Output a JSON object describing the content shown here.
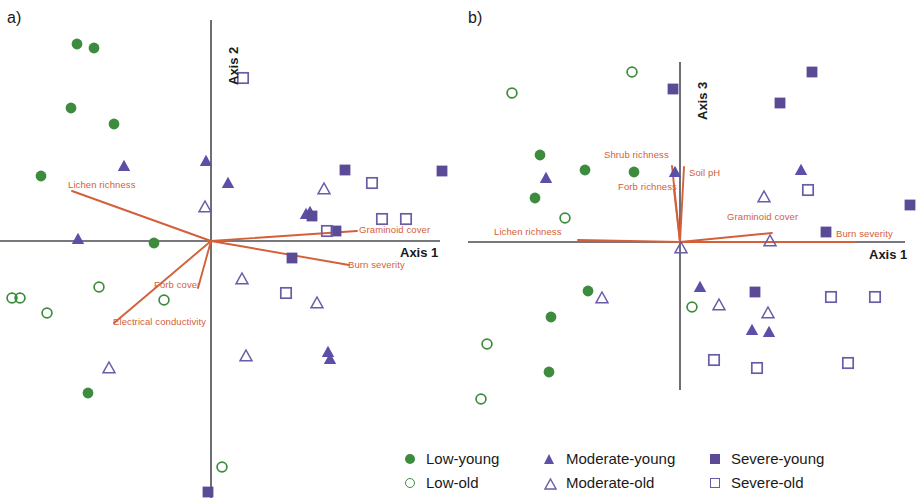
{
  "figure": {
    "panels": [
      {
        "letter": "a)",
        "x_axis_label": "Axis 1",
        "y_axis_label": "Axis 2"
      },
      {
        "letter": "b)",
        "x_axis_label": "Axis 1",
        "y_axis_label": "Axis 3"
      }
    ]
  },
  "legend": {
    "items": [
      {
        "label": "Low-young",
        "symbol": "filled-circle",
        "color": "#3d8b3d"
      },
      {
        "label": "Low-old",
        "symbol": "open-circle",
        "color": "#3d8b3d"
      },
      {
        "label": "Moderate-young",
        "symbol": "filled-triangle",
        "color": "#5b4fa8"
      },
      {
        "label": "Moderate-old",
        "symbol": "open-triangle",
        "color": "#6b5ca8"
      },
      {
        "label": "Severe-young",
        "symbol": "filled-square",
        "color": "#5b4a96"
      },
      {
        "label": "Severe-old",
        "symbol": "open-square",
        "color": "#6b5ca8"
      }
    ]
  },
  "colors": {
    "vector": "#d4603a",
    "vector_label": "#d4603a",
    "axis": "#4a4a52",
    "low": "#3d8b3d",
    "moderate": "#5b4fa8",
    "severe": "#5b4a96",
    "text": "#1a1a1a"
  },
  "chart_data": [
    {
      "type": "scatter",
      "title": "a)",
      "xlabel": "Axis 1",
      "ylabel": "Axis 2",
      "xlim": [
        -1.0,
        1.0
      ],
      "ylim": [
        -1.0,
        1.0
      ],
      "grid": false,
      "origin_px": [
        211,
        241
      ],
      "series": [
        {
          "name": "Low-young",
          "symbol": "filled-circle",
          "points_px": [
            [
              77,
              44
            ],
            [
              94,
              48
            ],
            [
              71,
              108
            ],
            [
              114,
              124
            ],
            [
              41,
              176
            ],
            [
              154,
              243
            ],
            [
              88,
              393
            ]
          ]
        },
        {
          "name": "Low-old",
          "symbol": "open-circle",
          "points_px": [
            [
              99,
              287
            ],
            [
              47,
              313
            ],
            [
              12,
              298
            ],
            [
              20,
              298
            ],
            [
              164,
              300
            ],
            [
              222,
              467
            ]
          ]
        },
        {
          "name": "Moderate-young",
          "symbol": "filled-triangle",
          "points_px": [
            [
              206,
              161
            ],
            [
              124,
              166
            ],
            [
              228,
              183
            ],
            [
              78,
              239
            ],
            [
              306,
              214
            ],
            [
              310,
              212
            ],
            [
              328,
              352
            ],
            [
              330,
              359
            ]
          ]
        },
        {
          "name": "Moderate-old",
          "symbol": "open-triangle",
          "points_px": [
            [
              205,
              207
            ],
            [
              324,
              189
            ],
            [
              317,
              303
            ],
            [
              242,
              279
            ],
            [
              246,
              356
            ],
            [
              109,
              368
            ]
          ]
        },
        {
          "name": "Severe-young",
          "symbol": "filled-square",
          "points_px": [
            [
              345,
              170
            ],
            [
              442,
              171
            ],
            [
              312,
              216
            ],
            [
              336,
              231
            ],
            [
              292,
              258
            ],
            [
              208,
              492
            ]
          ]
        },
        {
          "name": "Severe-old",
          "symbol": "open-square",
          "points_px": [
            [
              243,
              78
            ],
            [
              372,
              183
            ],
            [
              382,
              219
            ],
            [
              406,
              219
            ],
            [
              327,
              231
            ],
            [
              286,
              293
            ]
          ]
        }
      ],
      "vectors": [
        {
          "name": "Lichen richness",
          "label": "Lichen richness",
          "tip_px": [
            72,
            191
          ],
          "from_px": [
            211,
            241
          ]
        },
        {
          "name": "Forb cover",
          "label": "Forb cover",
          "tip_px": [
            198,
            288
          ],
          "from_px": [
            211,
            241
          ]
        },
        {
          "name": "Electrical conductivity",
          "label": "Electrical conductivity",
          "tip_px": [
            114,
            323
          ],
          "from_px": [
            211,
            241
          ]
        },
        {
          "name": "Graminoid cover",
          "label": "Graminoid cover",
          "tip_px": [
            357,
            231
          ],
          "from_px": [
            211,
            241
          ]
        },
        {
          "name": "Burn severity",
          "label": "Burn severity",
          "tip_px": [
            349,
            265
          ],
          "from_px": [
            211,
            241
          ]
        }
      ]
    },
    {
      "type": "scatter",
      "title": "b)",
      "xlabel": "Axis 1",
      "ylabel": "Axis 3",
      "xlim": [
        -1.0,
        1.0
      ],
      "ylim": [
        -1.0,
        1.0
      ],
      "grid": false,
      "origin_px": [
        680,
        242
      ],
      "series": [
        {
          "name": "Low-young",
          "symbol": "filled-circle",
          "points_px": [
            [
              540,
              155
            ],
            [
              585,
              170
            ],
            [
              634,
              172
            ],
            [
              535,
              198
            ],
            [
              588,
              291
            ],
            [
              551,
              317
            ],
            [
              549,
              372
            ]
          ]
        },
        {
          "name": "Low-old",
          "symbol": "open-circle",
          "points_px": [
            [
              512,
              93
            ],
            [
              632,
              72
            ],
            [
              565,
              218
            ],
            [
              692,
              307
            ],
            [
              487,
              344
            ],
            [
              481,
              399
            ]
          ]
        },
        {
          "name": "Moderate-young",
          "symbol": "filled-triangle",
          "points_px": [
            [
              546,
              178
            ],
            [
              675,
              172
            ],
            [
              801,
              170
            ],
            [
              700,
              287
            ],
            [
              752,
              330
            ],
            [
              769,
              332
            ]
          ]
        },
        {
          "name": "Moderate-old",
          "symbol": "open-triangle",
          "points_px": [
            [
              764,
              197
            ],
            [
              681,
              248
            ],
            [
              770,
              241
            ],
            [
              602,
              298
            ],
            [
              719,
              305
            ],
            [
              768,
              313
            ]
          ]
        },
        {
          "name": "Severe-young",
          "symbol": "filled-square",
          "points_px": [
            [
              673,
              89
            ],
            [
              812,
              72
            ],
            [
              780,
              103
            ],
            [
              910,
              205
            ],
            [
              826,
              232
            ],
            [
              755,
              292
            ]
          ]
        },
        {
          "name": "Severe-old",
          "symbol": "open-square",
          "points_px": [
            [
              808,
              190
            ],
            [
              831,
              297
            ],
            [
              875,
              297
            ],
            [
              714,
              360
            ],
            [
              757,
              368
            ],
            [
              848,
              363
            ]
          ]
        }
      ],
      "vectors": [
        {
          "name": "Lichen richness",
          "label": "Lichen richness",
          "tip_px": [
            578,
            240
          ],
          "from_px": [
            680,
            242
          ]
        },
        {
          "name": "Shrub richness",
          "label": "Shrub richness",
          "tip_px": [
            672,
            166
          ],
          "from_px": [
            680,
            242
          ]
        },
        {
          "name": "Forb richness",
          "label": "Forb richness",
          "tip_px": [
            674,
            190
          ],
          "from_px": [
            680,
            242
          ]
        },
        {
          "name": "Soil pH",
          "label": "Soil pH",
          "tip_px": [
            684,
            167
          ],
          "from_px": [
            680,
            242
          ]
        },
        {
          "name": "Graminoid cover",
          "label": "Graminoid cover",
          "tip_px": [
            772,
            233
          ],
          "from_px": [
            680,
            242
          ]
        },
        {
          "name": "Burn severity",
          "label": "Burn severity",
          "tip_px": [
            855,
            242
          ],
          "from_px": [
            680,
            242
          ]
        }
      ]
    }
  ]
}
